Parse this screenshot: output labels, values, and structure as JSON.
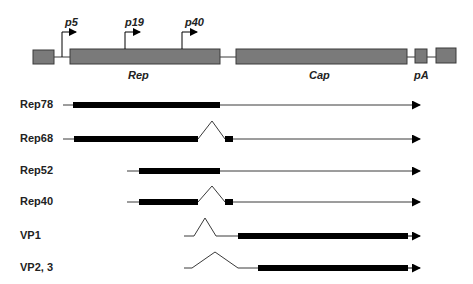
{
  "genome": {
    "promoters": [
      {
        "label": "p5",
        "x": 63
      },
      {
        "label": "p19",
        "x": 125
      },
      {
        "label": "p40",
        "x": 182
      }
    ],
    "regions": [
      {
        "label": "Rep"
      },
      {
        "label": "Cap"
      },
      {
        "label": "pA"
      }
    ]
  },
  "transcripts": [
    {
      "label": "Rep78"
    },
    {
      "label": "Rep68"
    },
    {
      "label": "Rep52"
    },
    {
      "label": "Rep40"
    },
    {
      "label": "VP1"
    },
    {
      "label": "VP2, 3"
    }
  ],
  "colors": {
    "box_fill": "#7a7a7a",
    "box_stroke": "#3a3a3a",
    "line": "#3a3a3a",
    "cds": "#000000"
  }
}
